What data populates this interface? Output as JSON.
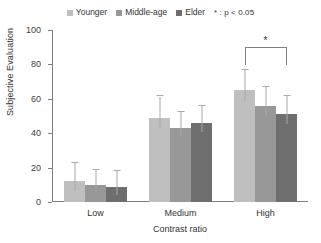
{
  "legend": {
    "entries": [
      {
        "label": "Younger",
        "color": "#bfbfbf",
        "icon": "legend-swatch-icon"
      },
      {
        "label": "Middle-age",
        "color": "#989898",
        "icon": "legend-swatch-icon"
      },
      {
        "label": "Elder",
        "color": "#6e6e6e",
        "icon": "legend-swatch-icon"
      }
    ],
    "note": "* : p < 0.05"
  },
  "chart_data": {
    "type": "bar",
    "title": "",
    "xlabel": "Contrast ratio",
    "ylabel": "Subjective Evaluation",
    "categories": [
      "Low",
      "Medium",
      "High"
    ],
    "ylim": [
      0,
      100
    ],
    "yticks": [
      0,
      20,
      40,
      60,
      80,
      100
    ],
    "grid": false,
    "legend_position": "top-center",
    "series": [
      {
        "name": "Younger",
        "color": "#bfbfbf",
        "values": [
          12,
          49,
          65
        ],
        "errors": [
          16,
          19,
          18
        ]
      },
      {
        "name": "Middle-age",
        "color": "#989898",
        "values": [
          10,
          43,
          56
        ],
        "errors": [
          13,
          14,
          17
        ]
      },
      {
        "name": "Elder",
        "color": "#6e6e6e",
        "values": [
          9,
          46,
          51
        ],
        "errors": [
          14,
          15,
          16
        ]
      }
    ],
    "annotations": [
      {
        "type": "significance-bracket",
        "group": "High",
        "from_series": "Younger",
        "to_series": "Elder",
        "label": "*",
        "y": 90
      }
    ]
  }
}
